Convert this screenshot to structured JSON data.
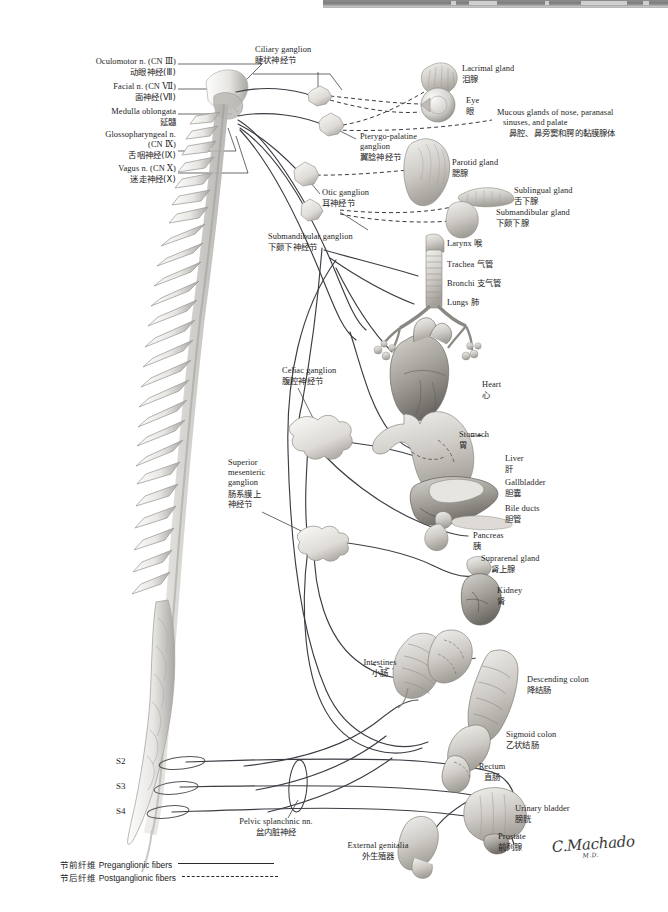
{
  "figure": {
    "background_color": "#ffffff",
    "ink_color": "#1d1d1d"
  },
  "top_strip": {
    "present": true,
    "color": "#7c7c7c"
  },
  "labels_left": [
    {
      "id": "oculomotor",
      "en": "Oculomotor n. (CN Ⅲ)",
      "zh": "动眼神经(Ⅲ)",
      "x": 30,
      "y": 62,
      "align": "right",
      "w": 145
    },
    {
      "id": "facial",
      "en": "Facial n. (CN Ⅶ)",
      "zh": "面神经(Ⅶ)",
      "x": 30,
      "y": 87,
      "align": "right",
      "w": 145
    },
    {
      "id": "medulla",
      "en": "Medulla oblongata",
      "zh": "延髓",
      "x": 30,
      "y": 112,
      "align": "right",
      "w": 145
    },
    {
      "id": "glossopharyngeal",
      "en": "Glossopharyngeal n.",
      "zh": "(CN Ⅸ)",
      "x": 26,
      "y": 135,
      "align": "right",
      "w": 149
    },
    {
      "id": "glossopharyngeal2",
      "en": "舌咽神经(Ⅸ)",
      "zh": "",
      "x": 26,
      "y": 155,
      "align": "right",
      "w": 149
    },
    {
      "id": "vagus",
      "en": "Vagus n. (CN Ⅹ)",
      "zh": "迷走神经(Ⅹ)",
      "x": 30,
      "y": 169,
      "align": "right",
      "w": 145
    }
  ],
  "labels_ganglia": [
    {
      "id": "ciliary-ganglion",
      "en": "Ciliary ganglion",
      "zh": "睫状神经节",
      "x": 255,
      "y": 50
    },
    {
      "id": "pterygopalatine-ganglion",
      "en": "Pterygo-palatine\nganglion",
      "zh": "翼腍神经节",
      "x": 360,
      "y": 134
    },
    {
      "id": "otic-ganglion",
      "en": "Otic ganglion",
      "zh": "耳神经节",
      "x": 322,
      "y": 190
    },
    {
      "id": "submandibular-ganglion",
      "en": "Submandibular ganglion",
      "zh": "下颇下神经节",
      "x": 268,
      "y": 235
    },
    {
      "id": "celiac-ganglion",
      "en": "Celiac ganglion",
      "zh": "腹腔神经节",
      "x": 282,
      "y": 370
    },
    {
      "id": "superior-mesenteric-ganglion",
      "en": "Superior\nmesenteric\nganglion",
      "zh": "肠系膜上\n神经节",
      "x": 228,
      "y": 462
    }
  ],
  "labels_organs": [
    {
      "id": "lacrimal-gland",
      "en": "Lacrimal gland",
      "zh": "泪腺",
      "x": 462,
      "y": 68
    },
    {
      "id": "eye",
      "en": "Eye",
      "zh": "眼",
      "x": 467,
      "y": 100
    },
    {
      "id": "mucous-glands",
      "en": "Mucous glands of nose, paranasal\nsinuses, and palate",
      "zh": "鼻腔、鼻旁窦和腭的黏膜腺体",
      "x": 497,
      "y": 112
    },
    {
      "id": "parotid-gland",
      "en": "Parotid gland",
      "zh": "腮腺",
      "x": 452,
      "y": 162
    },
    {
      "id": "sublingual-gland",
      "en": "Sublingual gland",
      "zh": "舌下腺",
      "x": 515,
      "y": 190
    },
    {
      "id": "submandibular-gland",
      "en": "Submandibular gland",
      "zh": "下颇下腺",
      "x": 497,
      "y": 212
    },
    {
      "id": "larynx",
      "en": "Larynx",
      "zh": "喉",
      "inline": true,
      "x": 443,
      "y": 241
    },
    {
      "id": "trachea",
      "en": "Trachea",
      "zh": "气管",
      "inline": true,
      "x": 443,
      "y": 262
    },
    {
      "id": "bronchi",
      "en": "Bronchi",
      "zh": "支气管",
      "inline": true,
      "x": 443,
      "y": 281
    },
    {
      "id": "lungs",
      "en": "Lungs",
      "zh": "肺",
      "inline": true,
      "x": 443,
      "y": 300
    },
    {
      "id": "heart",
      "en": "Heart",
      "zh": "心",
      "x": 482,
      "y": 384
    },
    {
      "id": "stomach",
      "en": "Stomach",
      "zh": "胃",
      "x": 459,
      "y": 434
    },
    {
      "id": "liver",
      "en": "Liver",
      "zh": "肝",
      "x": 505,
      "y": 458
    },
    {
      "id": "gallbladder",
      "en": "Gallbladder",
      "zh": "胆囊",
      "x": 505,
      "y": 482
    },
    {
      "id": "bile-ducts",
      "en": "Bile ducts",
      "zh": "胆管",
      "x": 505,
      "y": 508
    },
    {
      "id": "pancreas",
      "en": "Pancreas",
      "zh": "胰",
      "x": 473,
      "y": 535
    },
    {
      "id": "suprarenal-gland",
      "en": "Suprarenal gland",
      "zh": "肾上腺",
      "x": 481,
      "y": 558
    },
    {
      "id": "kidney",
      "en": "Kidney",
      "zh": "肾",
      "x": 497,
      "y": 590
    },
    {
      "id": "intestines",
      "en": "Intestines",
      "zh": "小肠",
      "x": 360,
      "y": 662
    },
    {
      "id": "descending-colon",
      "en": "Descending colon",
      "zh": "降结肠",
      "x": 527,
      "y": 679
    },
    {
      "id": "sigmoid-colon",
      "en": "Sigmoid colon",
      "zh": "乙状结肠",
      "x": 506,
      "y": 734
    },
    {
      "id": "rectum",
      "en": "Rectum",
      "zh": "直肠",
      "x": 475,
      "y": 766
    },
    {
      "id": "urinary-bladder",
      "en": "Urinary bladder",
      "zh": "膀胱",
      "x": 515,
      "y": 808
    },
    {
      "id": "prostate",
      "en": "Prostate",
      "zh": "前列腺",
      "x": 498,
      "y": 836
    },
    {
      "id": "external-genitalia",
      "en": "External genitalia",
      "zh": "外生殖器",
      "x": 333,
      "y": 845
    },
    {
      "id": "pelvic-splanchnic-nn",
      "en": "Pelvic splanchnic nn.",
      "zh": "盆内脏神经",
      "x": 226,
      "y": 821
    }
  ],
  "spinal_levels": [
    {
      "id": "s2",
      "label": "S2",
      "x": 116,
      "y": 762
    },
    {
      "id": "s3",
      "label": "S3",
      "x": 116,
      "y": 787
    },
    {
      "id": "s4",
      "label": "S4",
      "x": 116,
      "y": 812
    }
  ],
  "legend": {
    "preganglionic": {
      "zh": "节前纤维",
      "en": "Preganglionic fibers",
      "line_style": "solid"
    },
    "postganglionic": {
      "zh": "节后纤维",
      "en": "Postganglionic fibers",
      "line_style": "dashed"
    }
  },
  "signature": {
    "name": "C.Machado",
    "credential": "M.D."
  }
}
